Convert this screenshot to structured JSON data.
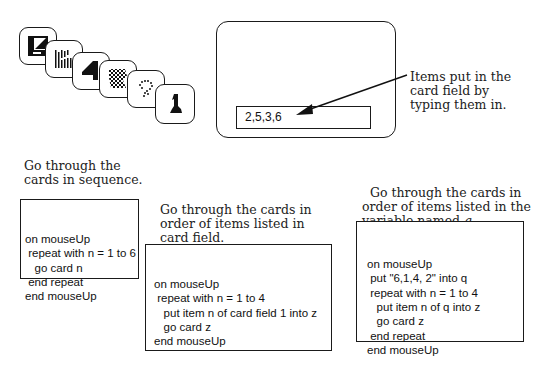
{
  "card_stack": {
    "cards": [
      {
        "index": 1,
        "icon": "z-shape-card-icon"
      },
      {
        "index": 2,
        "icon": "vertical-bars-card-icon"
      },
      {
        "index": 3,
        "icon": "number-four-card-icon"
      },
      {
        "index": 4,
        "icon": "checkerboard-card-icon"
      },
      {
        "index": 5,
        "icon": "dotted-question-card-icon"
      },
      {
        "index": 6,
        "icon": "number-one-card-icon"
      }
    ]
  },
  "card_window": {
    "field_value": "2,5,3,6",
    "annotation": "Items put in the\ncard field by\ntyping them in."
  },
  "examples": [
    {
      "caption": "Go through the\ncards in sequence.",
      "code": [
        "on mouseUp",
        " repeat with n = 1 to 6",
        "   go card n",
        " end repeat",
        "end mouseUp"
      ]
    },
    {
      "caption": "Go through the cards in\norder of items listed in\ncard field.",
      "code": [
        "on mouseUp",
        " repeat with n = 1 to 4",
        "   put item n of card field 1 into z",
        "   go card z",
        "end mouseUp"
      ]
    },
    {
      "caption_line1": "Go through the cards in",
      "caption_line2": "order of items listed in the",
      "caption_line3_prefix": "variable named ",
      "caption_var": "q",
      "caption_suffix": ".",
      "code": [
        "on mouseUp",
        " put \"6,1,4, 2\" into q",
        " repeat with n = 1 to 4",
        "   put item n of q into z",
        "   go card z",
        " end repeat",
        "end mouseUp"
      ]
    }
  ]
}
